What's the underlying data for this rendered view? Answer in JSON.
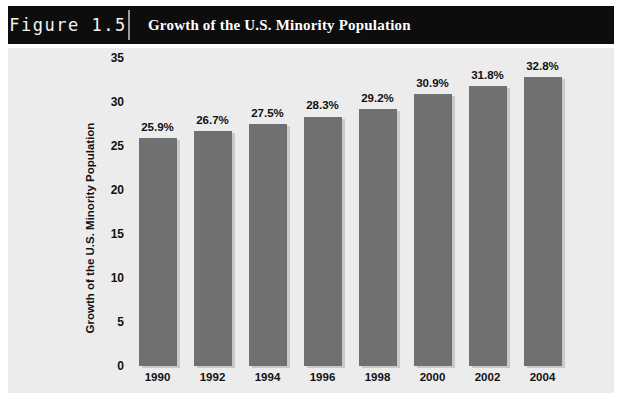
{
  "header": {
    "figure_number": "Figure 1.5",
    "title": "Growth of the U.S. Minority Population"
  },
  "colors": {
    "header_background": "#0d0d0e",
    "header_text": "#ffffff",
    "panel_background": "#ececed",
    "bar_fill": "#6e7072",
    "bar_shadow": "#c9c9ca",
    "axis_text": "#111111"
  },
  "source_note": "",
  "chart_data": {
    "type": "bar",
    "title": "Growth of the U.S. Minority Population",
    "xlabel": "",
    "ylabel": "Growth of the U.S. Minority Population",
    "categories": [
      "1990",
      "1992",
      "1994",
      "1996",
      "1998",
      "2000",
      "2002",
      "2004"
    ],
    "values": [
      25.9,
      26.7,
      27.5,
      28.3,
      29.2,
      30.9,
      31.8,
      32.8
    ],
    "data_labels": [
      "25.9%",
      "26.7%",
      "27.5%",
      "28.3%",
      "29.2%",
      "30.9%",
      "31.8%",
      "32.8%"
    ],
    "ylim": [
      0,
      35
    ],
    "yticks": [
      0,
      5,
      10,
      15,
      20,
      25,
      30,
      35
    ],
    "ytick_labels": [
      "0",
      "5",
      "10",
      "15",
      "20",
      "25",
      "30",
      "35"
    ],
    "grid": false,
    "legend": null
  }
}
